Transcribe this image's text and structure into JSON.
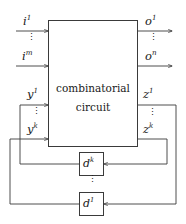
{
  "diagram": {
    "center_box": {
      "line1": "combinatorial",
      "line2": "circuit"
    },
    "inputs": [
      {
        "label": "i",
        "sup": "1",
        "name": "input-i1"
      },
      {
        "label": "i",
        "sup": "m",
        "name": "input-im"
      }
    ],
    "outputs": [
      {
        "label": "o",
        "sup": "1",
        "name": "output-o1"
      },
      {
        "label": "o",
        "sup": "n",
        "name": "output-on"
      }
    ],
    "state_in": [
      {
        "label": "y",
        "sup": "1",
        "name": "state-in-y1"
      },
      {
        "label": "y",
        "sup": "k",
        "name": "state-in-yk"
      }
    ],
    "state_out": [
      {
        "label": "z",
        "sup": "1",
        "name": "state-out-z1"
      },
      {
        "label": "z",
        "sup": "k",
        "name": "state-out-zk"
      }
    ],
    "delays": [
      {
        "label": "d",
        "sup": "k",
        "name": "delay-dk"
      },
      {
        "label": "d",
        "sup": "1",
        "name": "delay-d1"
      }
    ],
    "ellipsis": "⋮",
    "colors": {
      "line": "#3a3a3a",
      "text": "#1a1a1a",
      "background": "#ffffff"
    }
  }
}
